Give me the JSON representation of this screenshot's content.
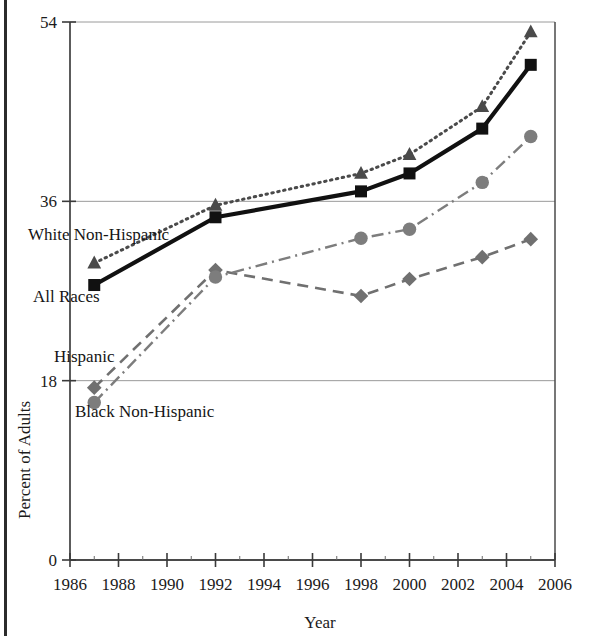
{
  "chart_data": {
    "type": "line",
    "title": "",
    "xlabel": "Year",
    "ylabel": "Percent of Adults",
    "xlim": [
      1986,
      2006
    ],
    "ylim": [
      0,
      54
    ],
    "ytick_values": [
      0,
      18,
      36,
      54
    ],
    "ytick_labels": [
      "0",
      "18",
      "36",
      "54"
    ],
    "xtick_values": [
      1986,
      1988,
      1990,
      1992,
      1994,
      1996,
      1998,
      2000,
      2002,
      2004,
      2006
    ],
    "xtick_labels": [
      "1986",
      "1988",
      "1990",
      "1992",
      "1994",
      "1996",
      "1998",
      "2000",
      "2002",
      "2004",
      "2006"
    ],
    "grid": "horizontal-at-18-36-54",
    "legend": "inline-series-labels",
    "x": [
      1987,
      1992,
      1998,
      2000,
      2003,
      2005
    ],
    "series": [
      {
        "name": "White Non-Hispanic",
        "label": "White Non-Hispanic",
        "marker": "triangle",
        "line_style": "dotted",
        "color": "#4a4a4a",
        "values": [
          29.8,
          35.6,
          38.8,
          40.7,
          45.5,
          53.0
        ]
      },
      {
        "name": "All Races",
        "label": "All Races",
        "marker": "square",
        "line_style": "solid",
        "color": "#111111",
        "values": [
          27.6,
          34.4,
          37.0,
          38.8,
          43.3,
          49.7
        ]
      },
      {
        "name": "Black Non-Hispanic",
        "label": "Black Non-Hispanic",
        "marker": "circle",
        "line_style": "dash-dot",
        "color": "#7d7d7d",
        "values": [
          15.8,
          28.4,
          32.3,
          33.2,
          37.9,
          42.5
        ]
      },
      {
        "name": "Hispanic",
        "label": "Hispanic",
        "marker": "diamond",
        "line_style": "dashed",
        "color": "#707070",
        "values": [
          17.3,
          29.1,
          26.5,
          28.2,
          30.4,
          32.2
        ]
      }
    ],
    "annotations": [
      {
        "text": "White Non-Hispanic",
        "x_px": 28,
        "y_px": 240
      },
      {
        "text": "All Races",
        "x_px": 33,
        "y_px": 302
      },
      {
        "text": "Hispanic",
        "x_px": 54,
        "y_px": 362
      },
      {
        "text": "Black Non-Hispanic",
        "x_px": 75,
        "y_px": 417
      }
    ],
    "axis_colors": {
      "axis_line": "#4a4a4a",
      "gridline": "#9a9a9a",
      "background": "#ffffff"
    }
  }
}
